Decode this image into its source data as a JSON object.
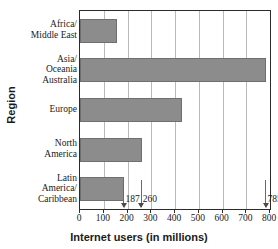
{
  "chart_data": {
    "type": "bar",
    "orientation": "horizontal",
    "title": "",
    "xlabel": "Internet users (in millions)",
    "ylabel": "Region",
    "categories": [
      "Africa/\nMiddle East",
      "Asia/\nOceania\nAustralia",
      "Europe",
      "North\nAmerica",
      "Latin\nAmerica/\nCaribbean"
    ],
    "values": [
      155,
      785,
      430,
      260,
      187
    ],
    "xlim": [
      0,
      800
    ],
    "xticks": [
      0,
      100,
      200,
      300,
      400,
      500,
      600,
      700,
      800
    ],
    "xticklabels": [
      "0",
      "100",
      "200",
      "300",
      "400",
      "500",
      "600",
      "700",
      "800"
    ],
    "grid": "vertical",
    "legend": "none",
    "bar_color": "#8c8c8c",
    "annotations": [
      {
        "value": 187,
        "label": "187",
        "category": "Latin America/Caribbean"
      },
      {
        "value": 260,
        "label": "260",
        "category": "North America"
      },
      {
        "value": 785,
        "label": "785",
        "category": "Asia/Oceania Australia"
      }
    ]
  },
  "axes": {
    "y_title": "Region",
    "x_title": "Internet users (in millions)"
  },
  "categories": [
    {
      "lines": [
        "Africa/",
        "Middle East"
      ]
    },
    {
      "lines": [
        "Asia/",
        "Oceania",
        "Australia"
      ]
    },
    {
      "lines": [
        "Europe"
      ]
    },
    {
      "lines": [
        "North",
        "America"
      ]
    },
    {
      "lines": [
        "Latin",
        "America/",
        "Caribbean"
      ]
    }
  ]
}
